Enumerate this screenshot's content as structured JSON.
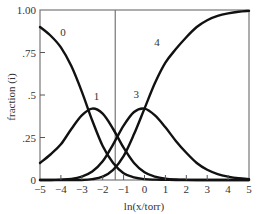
{
  "chart_data": {
    "type": "line",
    "title": "",
    "xlabel": "ln(x/torr)",
    "ylabel": "fraction (i)",
    "xlim": [
      -5,
      5
    ],
    "ylim": [
      0,
      1
    ],
    "grid": false,
    "legend": "none (curves labeled inline)",
    "x_ticks": [
      -5,
      -4,
      -3,
      -2,
      -1,
      0,
      1,
      2,
      3,
      4,
      5
    ],
    "x_tick_labels": [
      "−5",
      "−4",
      "−3",
      "−2",
      "−1",
      "0",
      "1",
      "2",
      "3",
      "4",
      "5"
    ],
    "y_ticks": [
      0,
      0.25,
      0.5,
      0.75,
      1.0
    ],
    "y_tick_labels": [
      "0",
      ".25",
      ".5",
      ".75",
      "1.00"
    ],
    "vertical_reference_line_x": -1.4,
    "x": [
      -5,
      -4.5,
      -4,
      -3.5,
      -3,
      -2.5,
      -2,
      -1.5,
      -1,
      -0.5,
      0,
      0.5,
      1,
      1.5,
      2,
      2.5,
      3,
      3.5,
      4,
      4.5,
      5
    ],
    "series": [
      {
        "name": "0",
        "values": [
          0.9,
          0.85,
          0.78,
          0.67,
          0.52,
          0.35,
          0.2,
          0.1,
          0.04,
          0.015,
          0.005,
          0.002,
          0.001,
          0,
          0,
          0,
          0,
          0,
          0,
          0,
          0
        ]
      },
      {
        "name": "1",
        "values": [
          0.1,
          0.15,
          0.21,
          0.3,
          0.38,
          0.42,
          0.39,
          0.3,
          0.19,
          0.1,
          0.045,
          0.02,
          0.008,
          0.003,
          0.001,
          0,
          0,
          0,
          0,
          0,
          0
        ]
      },
      {
        "name": "3",
        "values": [
          0,
          0,
          0.002,
          0.006,
          0.02,
          0.05,
          0.11,
          0.21,
          0.32,
          0.4,
          0.42,
          0.38,
          0.31,
          0.23,
          0.16,
          0.1,
          0.06,
          0.035,
          0.02,
          0.01,
          0.005
        ]
      },
      {
        "name": "4",
        "values": [
          0,
          0,
          0,
          0,
          0,
          0.005,
          0.02,
          0.06,
          0.14,
          0.27,
          0.42,
          0.57,
          0.69,
          0.77,
          0.84,
          0.9,
          0.94,
          0.965,
          0.98,
          0.99,
          0.995
        ]
      }
    ],
    "curve_label_positions": [
      {
        "name": "0",
        "x": -3.9,
        "y": 0.85
      },
      {
        "name": "1",
        "x": -2.3,
        "y": 0.47
      },
      {
        "name": "3",
        "x": -0.4,
        "y": 0.48
      },
      {
        "name": "4",
        "x": 0.6,
        "y": 0.79
      }
    ]
  }
}
